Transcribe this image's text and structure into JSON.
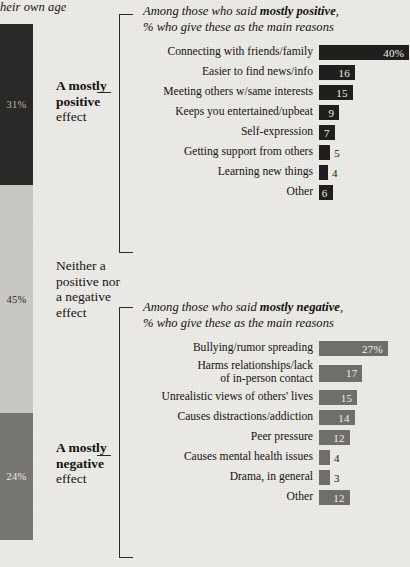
{
  "top_note": "heir own age",
  "stacked_bar": {
    "segments": [
      {
        "name": "mostly-positive",
        "value": "31%",
        "pct": 31,
        "label_bold": "A mostly",
        "label_bold2": "positive",
        "label_rest": "effect",
        "color": "#2a2927"
      },
      {
        "name": "neither",
        "value": "45%",
        "pct": 45,
        "label_line1": "Neither a",
        "label_line2": "positive nor",
        "label_line3": "a negative",
        "label_line4": "effect",
        "color": "#c9c7c3"
      },
      {
        "name": "mostly-negative",
        "value": "24%",
        "pct": 24,
        "label_bold": "A mostly",
        "label_bold2": "negative",
        "label_rest": "effect",
        "color": "#777672"
      }
    ]
  },
  "chart_data": [
    {
      "type": "bar",
      "orientation": "horizontal",
      "name": "mostly-positive-reasons",
      "title_prefix": "Among those who said ",
      "title_bold": "mostly positive",
      "title_suffix": ",",
      "subtitle": "% who give these as the main reasons",
      "bar_color": "#211f1e",
      "categories": [
        "Connecting with friends/family",
        "Easier to find news/info",
        "Meeting others w/same interests",
        "Keeps you entertained/upbeat",
        "Self-expression",
        "Getting support from others",
        "Learning new things",
        "Other"
      ],
      "values": [
        40,
        16,
        15,
        9,
        7,
        5,
        4,
        6
      ],
      "value_labels": [
        "40%",
        "16",
        "15",
        "9",
        "7",
        "5",
        "4",
        "6"
      ],
      "label_inside": [
        true,
        true,
        true,
        true,
        true,
        false,
        false,
        true
      ],
      "xlabel": "",
      "ylabel": "",
      "xlim": [
        0,
        40
      ],
      "grid": false,
      "legend": "none"
    },
    {
      "type": "bar",
      "orientation": "horizontal",
      "name": "mostly-negative-reasons",
      "title_prefix": "Among those who said ",
      "title_bold": "mostly negative",
      "title_suffix": ",",
      "subtitle": "% who give these as the main reasons",
      "bar_color": "#6f6e6b",
      "categories": [
        "Bullying/rumor spreading",
        "Harms relationships/lack of in-person contact",
        "Unrealistic views of others' lives",
        "Causes distractions/addiction",
        "Peer pressure",
        "Causes mental health issues",
        "Drama, in general",
        "Other"
      ],
      "values": [
        27,
        17,
        15,
        14,
        12,
        4,
        3,
        12
      ],
      "value_labels": [
        "27%",
        "17",
        "15",
        "14",
        "12",
        "4",
        "3",
        "12"
      ],
      "label_inside": [
        true,
        true,
        true,
        true,
        true,
        false,
        false,
        true
      ],
      "xlabel": "",
      "ylabel": "",
      "xlim": [
        0,
        27
      ],
      "grid": false,
      "legend": "none"
    }
  ],
  "rows_positive": [
    {
      "label": "Connecting with friends/family",
      "value": "40%"
    },
    {
      "label": "Easier to find news/info",
      "value": "16"
    },
    {
      "label": "Meeting others w/same interests",
      "value": "15"
    },
    {
      "label": "Keeps you entertained/upbeat",
      "value": "9"
    },
    {
      "label": "Self-expression",
      "value": "7"
    },
    {
      "label": "Getting support from others",
      "value": "5"
    },
    {
      "label": "Learning new things",
      "value": "4"
    },
    {
      "label": "Other",
      "value": "6"
    }
  ],
  "rows_negative": [
    {
      "label": "Bullying/rumor spreading",
      "value": "27%"
    },
    {
      "label1": "Harms relationships/lack",
      "label2": "of in-person contact",
      "value": "17"
    },
    {
      "label": "Unrealistic views of others' lives",
      "value": "15"
    },
    {
      "label": "Causes distractions/addiction",
      "value": "14"
    },
    {
      "label": "Peer pressure",
      "value": "12"
    },
    {
      "label": "Causes mental health issues",
      "value": "4"
    },
    {
      "label": "Drama, in general",
      "value": "3"
    },
    {
      "label": "Other",
      "value": "12"
    }
  ]
}
